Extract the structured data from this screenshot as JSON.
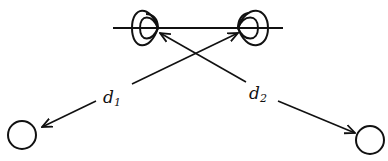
{
  "diagram": {
    "type": "two-source interference geometry",
    "colors": {
      "ink": "#111111",
      "background": "#ffffff"
    },
    "axis_line": {
      "x1": 113,
      "y1": 28,
      "x2": 283,
      "y2": 28
    },
    "sources": [
      {
        "name": "source-1",
        "cx": 146,
        "cy": 28
      },
      {
        "name": "source-2",
        "cx": 252,
        "cy": 28
      }
    ],
    "observers": [
      {
        "name": "observer-1",
        "cx": 22,
        "cy": 135,
        "r": 14
      },
      {
        "name": "observer-2",
        "cx": 370,
        "cy": 140,
        "r": 14
      }
    ],
    "distances": [
      {
        "label": "d",
        "subscript": "1",
        "from": "observer-1",
        "to": "source-2"
      },
      {
        "label": "d",
        "subscript": "2",
        "from": "source-1",
        "to": "observer-2"
      }
    ]
  }
}
